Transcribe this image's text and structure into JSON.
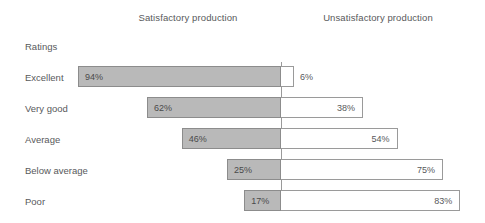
{
  "headers": {
    "left": "Satisfactory production",
    "right": "Unsatisfactory production",
    "ratings": "Ratings"
  },
  "colors": {
    "bar_fill": "#b9b9b9",
    "bar_border": "#8c8c8c",
    "right_fill": "#ffffff",
    "right_border": "#9a9a9a",
    "axis": "#9a9a9a",
    "text": "#58595b"
  },
  "chart_data": {
    "type": "bar",
    "title": "",
    "subtitle": "",
    "xlabel": "",
    "ylabel": "Ratings",
    "orientation": "horizontal",
    "stacked": true,
    "diverging": true,
    "grid": false,
    "legend_position": "top",
    "xlim": [
      0,
      100
    ],
    "unit": "%",
    "categories": [
      "Excellent",
      "Very good",
      "Average",
      "Below average",
      "Poor"
    ],
    "series": [
      {
        "name": "Satisfactory production",
        "values": [
          94,
          62,
          46,
          25,
          17
        ],
        "labels": [
          "94%",
          "62%",
          "46%",
          "25%",
          "17%"
        ]
      },
      {
        "name": "Unsatisfactory production",
        "values": [
          6,
          38,
          54,
          75,
          83
        ],
        "labels": [
          "6%",
          "38%",
          "54%",
          "75%",
          "83%"
        ]
      }
    ],
    "rows": [
      {
        "label": "Excellent",
        "left_value": 94,
        "left_label": "94%",
        "right_value": 6,
        "right_label": "6%",
        "right_label_outside": true
      },
      {
        "label": "Very good",
        "left_value": 62,
        "left_label": "62%",
        "right_value": 38,
        "right_label": "38%",
        "right_label_outside": false
      },
      {
        "label": "Average",
        "left_value": 46,
        "left_label": "46%",
        "right_value": 54,
        "right_label": "54%",
        "right_label_outside": false
      },
      {
        "label": "Below average",
        "left_value": 25,
        "left_label": "25%",
        "right_value": 75,
        "right_label": "75%",
        "right_label_outside": false
      },
      {
        "label": "Poor",
        "left_value": 17,
        "left_label": "17%",
        "right_value": 83,
        "right_label": "83%",
        "right_label_outside": false
      }
    ]
  },
  "layout": {
    "axis_x": 281,
    "px_per_percent": 2.16,
    "first_row_top": 66,
    "row_pitch": 31
  }
}
